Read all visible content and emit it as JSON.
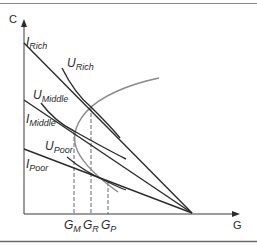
{
  "diagram": {
    "axes": {
      "y_label": "C",
      "x_label": "G"
    },
    "budget_lines": [
      {
        "name": "I",
        "sub": "Rich"
      },
      {
        "name": "I",
        "sub": "Middle"
      },
      {
        "name": "I",
        "sub": "Poor"
      }
    ],
    "indifference_curves": [
      {
        "name": "U",
        "sub": "Rich"
      },
      {
        "name": "U",
        "sub": "Middle"
      },
      {
        "name": "U",
        "sub": "Poor"
      }
    ],
    "x_ticks": [
      {
        "name": "G",
        "sub": "M"
      },
      {
        "name": "G",
        "sub": "R"
      },
      {
        "name": "G",
        "sub": "P"
      }
    ],
    "colors": {
      "lines": "#2b2b2b",
      "curve_gray": "#8a8a8a",
      "frame": "#7a7a7a"
    }
  }
}
